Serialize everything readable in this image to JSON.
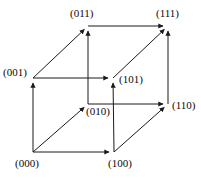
{
  "figure": {
    "background_color": "#ffffff",
    "line_color": "#1a1a1a",
    "label_color": "#0a0a0a",
    "width": 201,
    "height": 178
  },
  "chart_data": {
    "type": "diagram",
    "subtype": "directed-graph-cube",
    "title": "",
    "xlabel": "",
    "ylabel": "",
    "grid": false,
    "legend": false,
    "nodes": [
      {
        "id": "000",
        "label": "(000)",
        "x": 33,
        "y": 152,
        "label_x": 15,
        "label_y": 157,
        "label_anchor": "left"
      },
      {
        "id": "100",
        "label": "(100)",
        "x": 114,
        "y": 152,
        "label_x": 108,
        "label_y": 157,
        "label_anchor": "left"
      },
      {
        "id": "001",
        "label": "(001)",
        "x": 33,
        "y": 78,
        "label_x": 3,
        "label_y": 66,
        "label_anchor": "left"
      },
      {
        "id": "101",
        "label": "(101)",
        "x": 113,
        "y": 78,
        "label_x": 119,
        "label_y": 73,
        "label_anchor": "left"
      },
      {
        "id": "010",
        "label": "(010)",
        "x": 88,
        "y": 104,
        "label_x": 86,
        "label_y": 105,
        "label_anchor": "left"
      },
      {
        "id": "110",
        "label": "(110)",
        "x": 168,
        "y": 104,
        "label_x": 172,
        "label_y": 99,
        "label_anchor": "left"
      },
      {
        "id": "011",
        "label": "(011)",
        "x": 88,
        "y": 26,
        "label_x": 70,
        "label_y": 7,
        "label_anchor": "left"
      },
      {
        "id": "111",
        "label": "(111)",
        "x": 168,
        "y": 26,
        "label_x": 156,
        "label_y": 7,
        "label_anchor": "left"
      }
    ],
    "edges": [
      {
        "from": "000",
        "to": "100",
        "direction": "right",
        "bit_changed": 1
      },
      {
        "from": "000",
        "to": "001",
        "direction": "up",
        "bit_changed": 3
      },
      {
        "from": "000",
        "to": "010",
        "direction": "up-right",
        "bit_changed": 2
      },
      {
        "from": "100",
        "to": "101",
        "direction": "up",
        "bit_changed": 3
      },
      {
        "from": "100",
        "to": "110",
        "direction": "up-right",
        "bit_changed": 2
      },
      {
        "from": "001",
        "to": "101",
        "direction": "right",
        "bit_changed": 1
      },
      {
        "from": "001",
        "to": "011",
        "direction": "up-right",
        "bit_changed": 2
      },
      {
        "from": "010",
        "to": "110",
        "direction": "right",
        "bit_changed": 1
      },
      {
        "from": "010",
        "to": "011",
        "direction": "up",
        "bit_changed": 3
      },
      {
        "from": "101",
        "to": "111",
        "direction": "up-right",
        "bit_changed": 2
      },
      {
        "from": "110",
        "to": "111",
        "direction": "up",
        "bit_changed": 3
      },
      {
        "from": "011",
        "to": "111",
        "direction": "right",
        "bit_changed": 1
      }
    ]
  }
}
